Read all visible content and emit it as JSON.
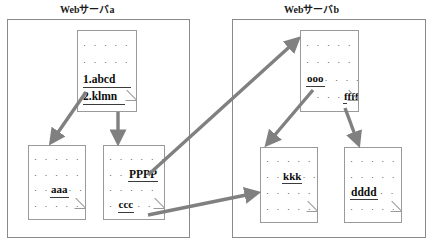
{
  "diagram": {
    "panels": [
      {
        "id": "server-a",
        "title": "Webサーバa"
      },
      {
        "id": "server-b",
        "title": "Webサーバb"
      }
    ],
    "documents": [
      {
        "id": "doc-abcd-klmn",
        "panel": "server-a",
        "position": "top",
        "rows": [
          {
            "type": "dots",
            "text": "· · · · · · ·"
          },
          {
            "type": "dots",
            "text": "· · · · · · ·"
          },
          {
            "type": "entry",
            "text": "1.abcd"
          },
          {
            "type": "entry",
            "text": "2.klmn"
          }
        ]
      },
      {
        "id": "doc-aaa",
        "panel": "server-a",
        "position": "bottom-left",
        "rows": [
          {
            "type": "dots",
            "text": "· · · · · · ·"
          },
          {
            "type": "dots",
            "text": "· · · · · · ·"
          },
          {
            "type": "word",
            "prefix": "· ·",
            "text": "aaa",
            "suffix": "· ·"
          },
          {
            "type": "dots",
            "text": "· · · · ·"
          }
        ]
      },
      {
        "id": "doc-pppp-ccc",
        "panel": "server-a",
        "position": "bottom-right",
        "rows": [
          {
            "type": "dots",
            "text": "· · · · · ·"
          },
          {
            "type": "word",
            "prefix": "· ·",
            "text": "PPPP",
            "suffix": ""
          },
          {
            "type": "dots",
            "text": "· · · · ·"
          },
          {
            "type": "word",
            "prefix": "·",
            "text": "ccc",
            "suffix": "· ·"
          }
        ]
      },
      {
        "id": "doc-ooo-ffff",
        "panel": "server-b",
        "position": "top",
        "rows": [
          {
            "type": "dots",
            "text": "· · · · · · ·"
          },
          {
            "type": "dots",
            "text": "· · · · · · ·"
          },
          {
            "type": "word",
            "prefix": "",
            "text": "ooo",
            "suffix": "· · · ·"
          },
          {
            "type": "word",
            "prefix": "· · · ·",
            "text": "ffff",
            "suffix": ""
          }
        ]
      },
      {
        "id": "doc-kkk",
        "panel": "server-b",
        "position": "bottom-left",
        "rows": [
          {
            "type": "dots",
            "text": "· · · · · · ·"
          },
          {
            "type": "word",
            "prefix": "· ·",
            "text": "kkk",
            "suffix": "· ·"
          },
          {
            "type": "dots",
            "text": "· · · · · · ·"
          },
          {
            "type": "dots",
            "text": "· · · · · · ·"
          }
        ]
      },
      {
        "id": "doc-dddd",
        "panel": "server-b",
        "position": "bottom-right",
        "rows": [
          {
            "type": "dots",
            "text": "· · · · · · ·"
          },
          {
            "type": "dots",
            "text": "· · · · · · ·"
          },
          {
            "type": "word",
            "prefix": "",
            "text": "dddd",
            "suffix": "· ·"
          },
          {
            "type": "dots",
            "text": "· · · · · ·"
          }
        ]
      }
    ],
    "arrows": [
      {
        "id": "arrow-abcd-to-aaa",
        "from": "doc-abcd-klmn",
        "to": "doc-aaa",
        "style": "single"
      },
      {
        "id": "arrow-klmn-to-pppp",
        "from": "doc-abcd-klmn",
        "to": "doc-pppp-ccc",
        "style": "single"
      },
      {
        "id": "arrow-pppp-to-ooo",
        "from": "doc-pppp-ccc",
        "to": "doc-ooo-ffff",
        "style": "single"
      },
      {
        "id": "arrow-ooo-to-kkk",
        "from": "doc-ooo-ffff",
        "to": "doc-kkk",
        "style": "single"
      },
      {
        "id": "arrow-ccc-to-kkk",
        "from": "doc-pppp-ccc",
        "to": "doc-kkk",
        "style": "single"
      },
      {
        "id": "arrow-ffff-to-dddd",
        "from": "doc-ooo-ffff",
        "to": "doc-dddd",
        "style": "single"
      }
    ],
    "colors": {
      "arrow": "#808080",
      "panel_border": "#8a8a8a",
      "doc_border": "#9a9a9a",
      "text": "#111111",
      "background": "#ffffff"
    }
  }
}
